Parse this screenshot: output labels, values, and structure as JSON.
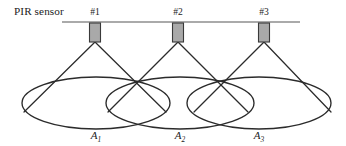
{
  "figure": {
    "caption_text": "PIR sensor"
  },
  "mount": {
    "line_label": "ceiling-mount-rail",
    "x_start": 62,
    "x_end": 300,
    "y": 22,
    "color": "#8e8e8e"
  },
  "sensors": [
    {
      "id": "#1",
      "x": 95,
      "box_top": 23,
      "box_width": 11,
      "box_height": 19,
      "fill": "#a9a9a9",
      "stroke": "#3a3a3a",
      "label_x": 95,
      "label_y": 17
    },
    {
      "id": "#2",
      "x": 178,
      "box_top": 23,
      "box_width": 11,
      "box_height": 19,
      "fill": "#a9a9a9",
      "stroke": "#3a3a3a",
      "label_x": 178,
      "label_y": 17
    },
    {
      "id": "#3",
      "x": 264,
      "box_top": 23,
      "box_width": 11,
      "box_height": 19,
      "fill": "#a9a9a9",
      "stroke": "#3a3a3a",
      "label_x": 264,
      "label_y": 17
    }
  ],
  "zones": [
    {
      "label": "A",
      "subscript": "1",
      "cx": 96,
      "cy": 103,
      "rx": 74,
      "ry": 26,
      "label_x": 96,
      "label_y": 136
    },
    {
      "label": "A",
      "subscript": "2",
      "cx": 180,
      "cy": 103,
      "rx": 74,
      "ry": 26,
      "label_x": 180,
      "label_y": 136
    },
    {
      "label": "A",
      "subscript": "3",
      "cx": 259,
      "cy": 103,
      "rx": 72,
      "ry": 26,
      "label_x": 259,
      "label_y": 136
    }
  ],
  "cones": [
    {
      "apex_x": 95,
      "apex_y": 42,
      "left_x": 24,
      "left_y": 112,
      "right_x": 166,
      "right_y": 112
    },
    {
      "apex_x": 178,
      "apex_y": 42,
      "left_x": 108,
      "left_y": 112,
      "right_x": 248,
      "right_y": 112
    },
    {
      "apex_x": 264,
      "apex_y": 42,
      "left_x": 194,
      "left_y": 112,
      "right_x": 331,
      "right_y": 112
    }
  ],
  "colors": {
    "ink": "#2b2b2b",
    "rail": "#8e8e8e",
    "sensor_fill": "#a9a9a9",
    "background": "#ffffff"
  }
}
